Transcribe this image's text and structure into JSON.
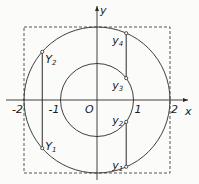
{
  "axes": {
    "x_label": "x",
    "y_label": "y",
    "origin_label": "O",
    "ticks": [
      {
        "value": -2,
        "label": "-2"
      },
      {
        "value": -1,
        "label": "-1"
      },
      {
        "value": 1,
        "label": "1"
      },
      {
        "value": 2,
        "label": "2"
      }
    ]
  },
  "circles": [
    {
      "name": "outer",
      "radius": 2
    },
    {
      "name": "inner",
      "radius": 1
    }
  ],
  "bounding_square": {
    "half_side": 2,
    "style": "dashed"
  },
  "chords": [
    {
      "name": "left-chord",
      "x": -1.5,
      "points": [
        {
          "label": "Y",
          "sub": "2",
          "y": 1.32
        },
        {
          "label": "Y",
          "sub": "1",
          "y": -1.32
        }
      ]
    },
    {
      "name": "right-chord-upper",
      "x": 0.8,
      "points": [
        {
          "label": "y",
          "sub": "4",
          "y": 1.83
        },
        {
          "label": "y",
          "sub": "3",
          "y": 0.6
        }
      ]
    },
    {
      "name": "right-chord-lower",
      "x": 0.8,
      "points": [
        {
          "label": "y",
          "sub": "2",
          "y": -0.6
        },
        {
          "label": "y",
          "sub": "1",
          "y": -1.83
        }
      ]
    }
  ],
  "colors": {
    "line": "#2a2a2a",
    "dash": "#555555",
    "background": "#fbfbfa"
  }
}
